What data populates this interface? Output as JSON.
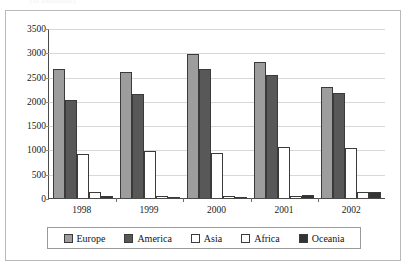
{
  "top_caption": "(in thousands)",
  "legend": {
    "position": "bottom",
    "entries": [
      {
        "label": "Europe",
        "color": "#9d9d9d",
        "swatch_icon": "legend-swatch-europe"
      },
      {
        "label": "America",
        "color": "#585858",
        "swatch_icon": "legend-swatch-america"
      },
      {
        "label": "Asia",
        "color": "#ffffff",
        "swatch_icon": "legend-swatch-asia"
      },
      {
        "label": "Africa",
        "color": "#fbfbfb",
        "swatch_icon": "legend-swatch-africa"
      },
      {
        "label": "Oceania",
        "color": "#333333",
        "swatch_icon": "legend-swatch-oceania"
      }
    ]
  },
  "axes": {
    "y_ticks": [
      "0",
      "500",
      "1000",
      "1500",
      "2000",
      "2500",
      "3000",
      "3500"
    ],
    "x_ticks": [
      "1998",
      "1999",
      "2000",
      "2001",
      "2002"
    ]
  },
  "chart_data": {
    "type": "bar",
    "title": "",
    "subtitle": "",
    "xlabel": "",
    "ylabel": "",
    "categories": [
      "1998",
      "1999",
      "2000",
      "2001",
      "2002"
    ],
    "ylim": [
      0,
      3500
    ],
    "ytick_step": 500,
    "grid": true,
    "grid_axis": "y",
    "legend_position": "bottom",
    "series": [
      {
        "name": "Europe",
        "color": "#9d9d9d",
        "values": [
          2650,
          2600,
          2960,
          2810,
          2280
        ]
      },
      {
        "name": "America",
        "color": "#585858",
        "values": [
          2010,
          2150,
          2650,
          2540,
          2160
        ]
      },
      {
        "name": "Asia",
        "color": "#ffffff",
        "values": [
          900,
          960,
          920,
          1050,
          1020
        ]
      },
      {
        "name": "Africa",
        "color": "#fbfbfb",
        "values": [
          120,
          45,
          45,
          40,
          130
        ]
      },
      {
        "name": "Oceania",
        "color": "#333333",
        "values": [
          40,
          20,
          5,
          60,
          120
        ]
      }
    ]
  }
}
